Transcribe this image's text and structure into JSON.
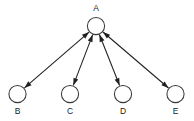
{
  "diagram": {
    "type": "directed-graph",
    "title": "",
    "background_color": "#ffffff",
    "line_color": "#211f1f",
    "node_stroke_color": "#3a3838",
    "node_fill_color": "#ffffff",
    "label_color": "#1c1b1b",
    "nodes": [
      {
        "id": "A",
        "label": "A",
        "cx": 96,
        "cy": 26,
        "r": 8.6,
        "label_x": 96,
        "label_y": 8.5
      },
      {
        "id": "B",
        "label": "B",
        "cx": 17.5,
        "cy": 94,
        "r": 8.6,
        "label_x": 17.5,
        "label_y": 112
      },
      {
        "id": "C",
        "label": "C",
        "cx": 70,
        "cy": 94,
        "r": 8.6,
        "label_x": 70,
        "label_y": 112
      },
      {
        "id": "D",
        "label": "D",
        "cx": 123,
        "cy": 94,
        "r": 8.6,
        "label_x": 123,
        "label_y": 112
      },
      {
        "id": "E",
        "label": "E",
        "cx": 175.5,
        "cy": 94,
        "r": 8.6,
        "label_x": 175.5,
        "label_y": 112
      }
    ],
    "edges": [
      {
        "id": "edge-a-b",
        "from": "A",
        "to": "B",
        "arrow_at_from": true,
        "arrow_at_to": true
      },
      {
        "id": "edge-a-c",
        "from": "A",
        "to": "C",
        "arrow_at_from": true,
        "arrow_at_to": true
      },
      {
        "id": "edge-a-d",
        "from": "A",
        "to": "D",
        "arrow_at_from": true,
        "arrow_at_to": true
      },
      {
        "id": "edge-a-e",
        "from": "A",
        "to": "E",
        "arrow_at_from": true,
        "arrow_at_to": true
      }
    ]
  }
}
